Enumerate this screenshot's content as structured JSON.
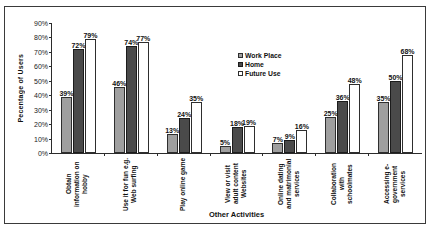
{
  "chart_data": {
    "type": "bar",
    "title": "",
    "xlabel": "Other Activities",
    "ylabel": "Pecentage of Users",
    "ylim": [
      0,
      90
    ],
    "ytick_labels": [
      "0%",
      "10%",
      "20%",
      "30%",
      "40%",
      "50%",
      "60%",
      "70%",
      "80%",
      "90%"
    ],
    "grid": false,
    "legend_position": "inside-top-center",
    "categories": [
      "Obtain information on hobby",
      "Use it for fun e.g. Web surfing",
      "Play online game",
      "View or visit adult content Websites",
      "Online dating and matrimonial services",
      "Collaboration with schoolmates",
      "Accessing e-government services"
    ],
    "series": [
      {
        "name": "Work Place",
        "color": "#9f9f9f",
        "values": [
          39,
          46,
          13,
          5,
          7,
          25,
          35
        ],
        "labels": [
          "39%",
          "46%",
          "13%",
          "5%",
          "7%",
          "25%",
          "35%"
        ]
      },
      {
        "name": "Home",
        "color": "#4a4a4a",
        "values": [
          72,
          74,
          24,
          18,
          9,
          36,
          50
        ],
        "labels": [
          "72%",
          "74%",
          "24%",
          "18%",
          "9%",
          "36%",
          "50%"
        ]
      },
      {
        "name": "Future Use",
        "color": "#ffffff",
        "values": [
          79,
          77,
          35,
          19,
          16,
          48,
          68
        ],
        "labels": [
          "79%",
          "77%",
          "35%",
          "19%",
          "16%",
          "48%",
          "68%"
        ]
      }
    ]
  }
}
